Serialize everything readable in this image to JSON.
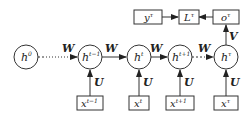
{
  "diagram": {
    "type": "unrolled-rnn",
    "colors": {
      "stroke": "#333333",
      "text": "#222222",
      "background": "#ffffff"
    },
    "hidden_nodes": [
      {
        "id": "h0",
        "base": "h",
        "sup": "0"
      },
      {
        "id": "h_tm1",
        "base": "h",
        "sup": "t−1"
      },
      {
        "id": "h_t",
        "base": "h",
        "sup": "t"
      },
      {
        "id": "h_tp1",
        "base": "h",
        "sup": "t+1"
      },
      {
        "id": "h_tau",
        "base": "h",
        "sup": "τ"
      }
    ],
    "input_nodes": [
      {
        "id": "x_tm1",
        "base": "x",
        "sup": "t−1"
      },
      {
        "id": "x_t",
        "base": "x",
        "sup": "t"
      },
      {
        "id": "x_tp1",
        "base": "x",
        "sup": "t+1"
      },
      {
        "id": "x_tau",
        "base": "x",
        "sup": "τ"
      }
    ],
    "output_nodes": [
      {
        "id": "y_tau",
        "base": "y",
        "sup": "τ"
      },
      {
        "id": "L_tau",
        "base": "L",
        "sup": "τ"
      },
      {
        "id": "o_tau",
        "base": "o",
        "sup": "τ"
      }
    ],
    "edge_labels": {
      "recurrent": "W",
      "input": "U",
      "output": "V"
    },
    "edges": [
      {
        "from": "h0",
        "to": "h_tm1",
        "label": "W",
        "style": "dotted"
      },
      {
        "from": "h_tm1",
        "to": "h_t",
        "label": "W",
        "style": "solid"
      },
      {
        "from": "h_t",
        "to": "h_tp1",
        "label": "W",
        "style": "solid"
      },
      {
        "from": "h_tp1",
        "to": "h_tau",
        "label": "W",
        "style": "dotted"
      },
      {
        "from": "x_tm1",
        "to": "h_tm1",
        "label": "U"
      },
      {
        "from": "x_t",
        "to": "h_t",
        "label": "U"
      },
      {
        "from": "x_tp1",
        "to": "h_tp1",
        "label": "U"
      },
      {
        "from": "x_tau",
        "to": "h_tau",
        "label": "U"
      },
      {
        "from": "h_tau",
        "to": "o_tau",
        "label": "V"
      },
      {
        "from": "o_tau",
        "to": "L_tau",
        "label": ""
      },
      {
        "from": "y_tau",
        "to": "L_tau",
        "label": ""
      }
    ]
  }
}
